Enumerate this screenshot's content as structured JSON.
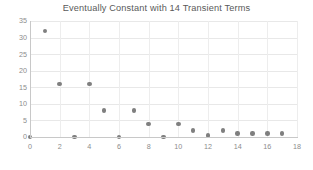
{
  "chart_data": {
    "type": "scatter",
    "title": "Eventually Constant with 14 Transient Terms",
    "xlabel": "",
    "ylabel": "",
    "xlim": [
      0,
      18
    ],
    "ylim": [
      0,
      35
    ],
    "xticks": [
      0,
      2,
      4,
      6,
      8,
      10,
      12,
      14,
      16,
      18
    ],
    "yticks": [
      0,
      5,
      10,
      15,
      20,
      25,
      30,
      35
    ],
    "grid": true,
    "legend": null,
    "legend_position": "none",
    "marker_color": "#7f7f7f",
    "background_color": "#ffffff",
    "gridline_color": "#e8e8e8",
    "axis_color": "#c8c8c8",
    "tick_label_color": "#8c8c8c",
    "title_color": "#595959",
    "series": [
      {
        "name": "sequence",
        "x": [
          0,
          1,
          2,
          3,
          4,
          5,
          6,
          7,
          8,
          9,
          10,
          11,
          12,
          13,
          14,
          15,
          16,
          17
        ],
        "values": [
          0,
          32,
          16,
          0,
          16,
          8,
          0,
          8,
          4,
          0,
          4,
          2,
          0.5,
          2,
          1,
          1,
          1,
          1
        ]
      }
    ]
  }
}
